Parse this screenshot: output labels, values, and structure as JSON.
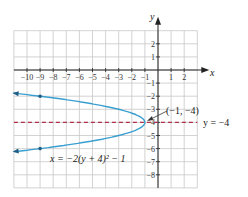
{
  "chart_data": {
    "type": "line",
    "title": "",
    "xlabel": "x",
    "ylabel": "y",
    "xlim": [
      -11,
      3
    ],
    "ylim": [
      -9,
      3
    ],
    "grid": true,
    "x_ticks": [
      "-10",
      "-9",
      "-8",
      "-7",
      "-6",
      "-5",
      "-4",
      "-3",
      "-2",
      "-1",
      "1",
      "2"
    ],
    "y_ticks": [
      "2",
      "1",
      "-1",
      "-2",
      "-3",
      "-4",
      "-5",
      "-6",
      "-7",
      "-8"
    ],
    "series": [
      {
        "name": "x = -2(y + 4)^2 - 1",
        "type": "parabola",
        "color": "#3a9fd0",
        "points": [
          [
            -11.1,
            -1.76
          ],
          [
            -9,
            -2
          ],
          [
            -3,
            -3
          ],
          [
            -1,
            -4
          ],
          [
            -3,
            -5
          ],
          [
            -9,
            -6
          ],
          [
            -11.1,
            -6.24
          ]
        ],
        "marked_points": [
          [
            -9,
            -2
          ],
          [
            -9,
            -6
          ]
        ]
      },
      {
        "name": "y = -4",
        "type": "axis_of_symmetry",
        "style": "dashed",
        "color": "#b0304a",
        "y": -4
      }
    ],
    "annotations": [
      {
        "text": "(−1, −4)",
        "point": [
          -1,
          -4
        ],
        "arrow": true
      },
      {
        "text": "y = −4",
        "position": "right of dashed line"
      },
      {
        "text": "x = −2(y + 4)² − 1",
        "position": "lower left of curve"
      }
    ]
  },
  "labels": {
    "x_axis": "x",
    "y_axis": "y",
    "vertex": "(−1, −4)",
    "axis_line": "y = −4",
    "equation": "x = −2(y + 4)² − 1"
  }
}
